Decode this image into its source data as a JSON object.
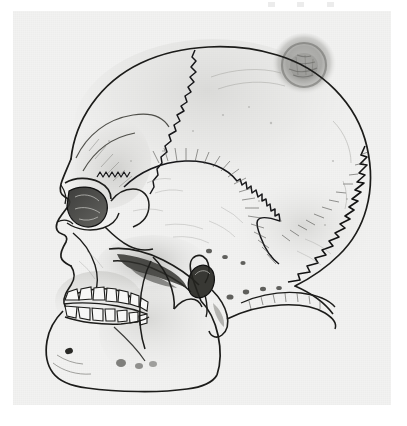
{
  "figure": {
    "title": "Human skull, left lateral view",
    "medium": "graphite and ink line drawing",
    "orientation": "left lateral (profile facing left)",
    "background_color": "#ffffff",
    "paper_color": "#f2f2f1",
    "ink_color": "#1a1a1a",
    "shading_color": "#8c8c8c"
  },
  "canvas": {
    "width": 407,
    "height": 426,
    "paper_left": 13,
    "paper_top": 11,
    "paper_width": 378,
    "paper_height": 394
  },
  "anatomy": {
    "regions": [
      {
        "name": "frontal-bone",
        "label": "Frontal bone"
      },
      {
        "name": "parietal-bone",
        "label": "Parietal bone"
      },
      {
        "name": "occipital-bone",
        "label": "Occipital bone"
      },
      {
        "name": "temporal-bone",
        "label": "Temporal bone"
      },
      {
        "name": "sphenoid-greater-wing",
        "label": "Greater wing of sphenoid"
      },
      {
        "name": "zygomatic-bone",
        "label": "Zygomatic bone"
      },
      {
        "name": "maxilla",
        "label": "Maxilla"
      },
      {
        "name": "nasal-bone",
        "label": "Nasal bone"
      },
      {
        "name": "mandible",
        "label": "Mandible"
      }
    ],
    "sutures": [
      {
        "name": "coronal-suture",
        "label": "Coronal suture",
        "character": "serrated, descends from vertex anteriorly"
      },
      {
        "name": "squamous-suture",
        "label": "Squamous suture",
        "character": "arched with fine radiating hatching"
      },
      {
        "name": "lambdoid-suture",
        "label": "Lambdoid suture",
        "character": "strongly zig-zag, posterior"
      }
    ],
    "features": [
      {
        "name": "orbit",
        "label": "Orbital cavity"
      },
      {
        "name": "supraorbital-margin",
        "label": "Supraorbital margin"
      },
      {
        "name": "nasal-aperture",
        "label": "Nasal aperture"
      },
      {
        "name": "zygomatic-arch",
        "label": "Zygomatic arch"
      },
      {
        "name": "temporal-fossa",
        "label": "Temporal fossa"
      },
      {
        "name": "external-acoustic-meatus",
        "label": "External acoustic meatus"
      },
      {
        "name": "mastoid-process",
        "label": "Mastoid process"
      },
      {
        "name": "coronoid-process",
        "label": "Coronoid process of mandible"
      },
      {
        "name": "condylar-process",
        "label": "Condylar process of mandible"
      },
      {
        "name": "mandibular-ramus",
        "label": "Ramus of mandible"
      },
      {
        "name": "mandibular-angle",
        "label": "Angle of mandible"
      },
      {
        "name": "mental-protuberance",
        "label": "Mental protuberance"
      },
      {
        "name": "mental-foramen",
        "label": "Mental foramen"
      },
      {
        "name": "parietal-lesion",
        "label": "Circular parietal depression / lesion"
      },
      {
        "name": "nuchal-lines",
        "label": "Nuchal lines"
      },
      {
        "name": "styloid-process",
        "label": "Styloid process"
      }
    ],
    "dentition": {
      "upper_row_label": "Maxillary teeth",
      "lower_row_label": "Mandibular teeth",
      "upper_visible_count": 7,
      "lower_visible_count": 7,
      "occlusion": "teeth in occlusion"
    }
  },
  "artifacts": {
    "top_scan_marks": 3
  }
}
